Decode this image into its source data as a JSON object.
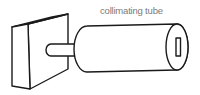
{
  "diagram": {
    "title": "",
    "labels": {
      "tube": "collimating tube"
    },
    "components": [
      {
        "id": "source-box",
        "shape": "rectangular block"
      },
      {
        "id": "connector-rod",
        "shape": "short cylinder"
      },
      {
        "id": "collimating-tube",
        "shape": "cylinder"
      },
      {
        "id": "exit-slit",
        "shape": "narrow rectangle"
      }
    ],
    "colors": {
      "line": "#1a1a1a",
      "label": "#7a7a7a",
      "background": "#ffffff"
    }
  }
}
